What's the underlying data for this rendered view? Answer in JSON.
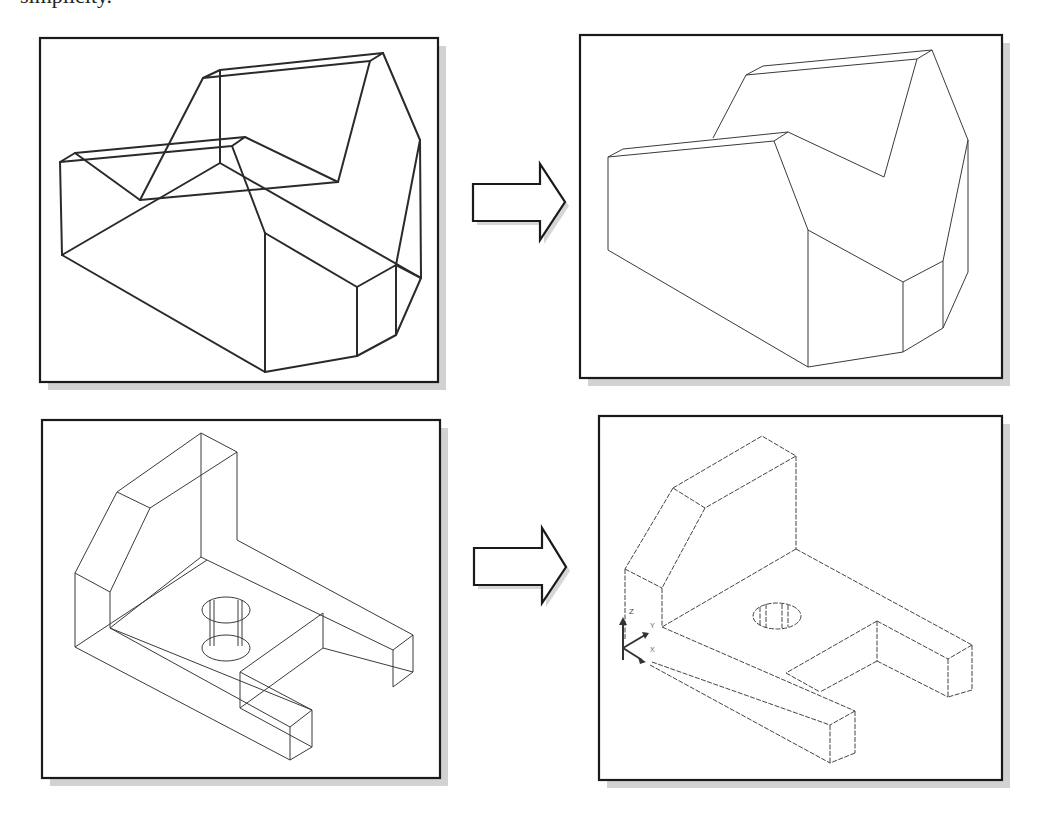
{
  "page": {
    "top_text_fragment": "simplicity."
  },
  "figures": [
    {
      "id": "panel-1",
      "label": "Wireframe model 1 (wireframe view)",
      "style": "wireframe"
    },
    {
      "id": "panel-2",
      "label": "Model 1 (hidden lines removed)",
      "style": "hidden-line"
    },
    {
      "id": "panel-3",
      "label": "Wireframe model 2 with hole (wireframe view)",
      "style": "wireframe"
    },
    {
      "id": "panel-4",
      "label": "Model 2 with hole (hidden lines removed)",
      "style": "hidden-line"
    }
  ],
  "arrows": [
    {
      "id": "arrow-1",
      "icon": "right-arrow-icon",
      "direction": "right"
    },
    {
      "id": "arrow-2",
      "icon": "right-arrow-icon",
      "direction": "right"
    }
  ],
  "ucs_icon": {
    "icon": "ucs-axis-icon",
    "labels": {
      "z": "Z",
      "y": "Y",
      "x": "X"
    }
  },
  "colors": {
    "frame": "#1a1a1a",
    "shadow": "#d2d2d2",
    "line": "#2a2a2a",
    "background": "#ffffff"
  }
}
